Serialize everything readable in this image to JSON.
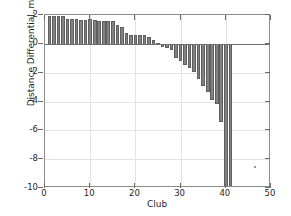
{
  "chart_data": {
    "type": "bar",
    "title": "",
    "xlabel": "Club",
    "ylabel": "Distance Differential, m",
    "xlim": [
      0,
      50
    ],
    "ylim": [
      -10,
      2
    ],
    "xticks": [
      0,
      10,
      20,
      30,
      40,
      50
    ],
    "yticks": [
      2,
      0,
      -2,
      -4,
      -6,
      -8,
      -10
    ],
    "grid": true,
    "legend": null,
    "bar_color": "#828282",
    "bar_edge_color": "#5e5e5e",
    "axis_color": "#8c8c8c",
    "grid_color": "#e3e3e3",
    "note": "Last bar is clipped at the axis minimum of -10",
    "categories": [
      1,
      2,
      3,
      4,
      5,
      6,
      7,
      8,
      9,
      10,
      11,
      12,
      13,
      14,
      15,
      16,
      17,
      18,
      19,
      20,
      21,
      22,
      23,
      24,
      25,
      26,
      27,
      28,
      29,
      30,
      31,
      32,
      33,
      34,
      35,
      36,
      37,
      38,
      39,
      40,
      41
    ],
    "values": [
      1.95,
      1.95,
      1.95,
      1.9,
      1.75,
      1.7,
      1.7,
      1.68,
      1.68,
      1.7,
      1.62,
      1.58,
      1.55,
      1.6,
      1.6,
      1.3,
      1.2,
      0.72,
      0.62,
      0.6,
      0.62,
      0.6,
      0.5,
      0.3,
      0.05,
      -0.2,
      -0.3,
      -0.45,
      -0.95,
      -1.2,
      -1.45,
      -1.7,
      -1.95,
      -2.45,
      -2.9,
      -3.35,
      -3.9,
      -4.2,
      -5.4,
      -10.0,
      -10.0
    ],
    "annotations": [
      {
        "name": "stray-speck",
        "x": 46.2,
        "y": -8.5
      }
    ]
  },
  "axis": {
    "y_tick_labels": [
      "2",
      "0",
      "-2",
      "-4",
      "-6",
      "-8",
      "-10"
    ],
    "x_tick_labels": [
      "0",
      "10",
      "20",
      "30",
      "40",
      "50"
    ]
  }
}
